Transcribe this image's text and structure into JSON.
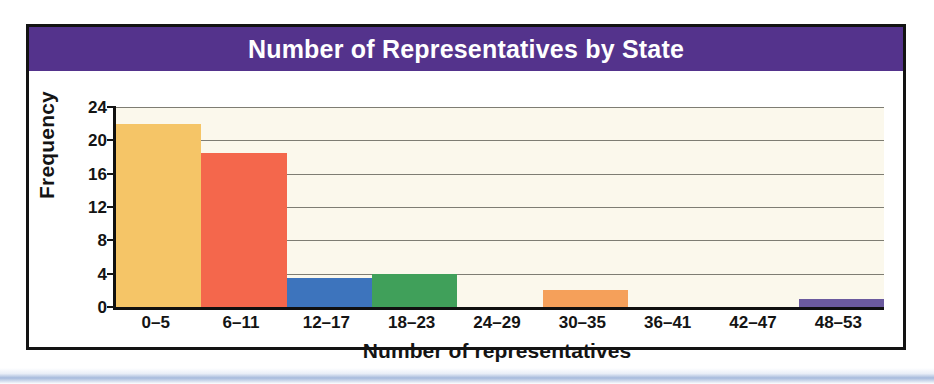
{
  "chart_data": {
    "type": "bar",
    "title": "Number of Representatives by State",
    "xlabel": "Number of representatives",
    "ylabel": "Frequency",
    "categories": [
      "0–5",
      "6–11",
      "12–17",
      "18–23",
      "24–29",
      "30–35",
      "36–41",
      "42–47",
      "48–53"
    ],
    "values": [
      22,
      18.5,
      3.5,
      4,
      0,
      2,
      0,
      0,
      1
    ],
    "bar_colors": [
      "#f5c567",
      "#f4674c",
      "#3d74bd",
      "#40a05a",
      "#fbf8ec",
      "#f5a05a",
      "#fbf8ec",
      "#fbf8ec",
      "#6b5a9e"
    ],
    "ylim": [
      0,
      24
    ],
    "y_ticks": [
      0,
      4,
      8,
      12,
      16,
      20,
      24
    ],
    "y_tick_labels": [
      "0",
      "4",
      "8",
      "12",
      "16",
      "20",
      "24"
    ],
    "grid": true,
    "grid_axis": "y",
    "legend": false,
    "plot_background": "#fbf8ec",
    "banner_color": "#54338c",
    "banner_text_color": "#ffffff",
    "axis_color": "#101010",
    "gridline_color": "#7e7d73"
  }
}
